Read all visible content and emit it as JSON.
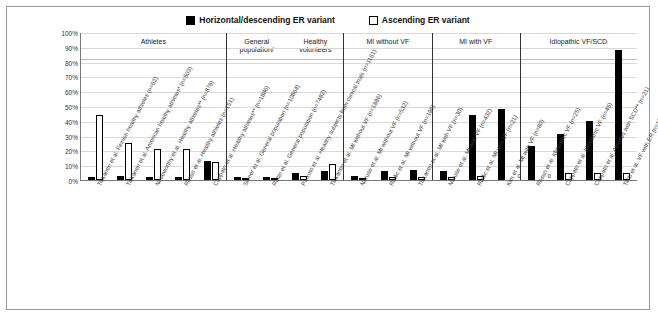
{
  "legend": {
    "items": [
      {
        "label": "Horizontal/descending ER variant",
        "swatch": "black"
      },
      {
        "label": "Ascending ER variant",
        "swatch": "white"
      }
    ]
  },
  "axis": {
    "yticks": [
      "100%",
      "90%",
      "80%",
      "70%",
      "60%",
      "50%",
      "40%",
      "30%",
      "20%",
      "10%",
      "0%"
    ]
  },
  "groups": [
    {
      "name": "Athletes",
      "count": 5
    },
    {
      "name": "General population/\nHealthy volunteers",
      "count": 4
    },
    {
      "name": "MI without VF",
      "count": 3
    },
    {
      "name": "MI with VF",
      "count": 3
    },
    {
      "name": "Idiopathic VF/SCD",
      "count": 4
    }
  ],
  "chart_data": {
    "type": "bar",
    "title": "",
    "xlabel": "",
    "ylabel": "",
    "ylim": [
      0,
      100
    ],
    "grid": true,
    "legend_position": "top-center",
    "categories": [
      "Tikkanen et al. Finnish healthy athletes (n=62)",
      "Tikkanen et al. American healthy athletes* (n=503)",
      "Noseworthy et al. Healthy athletes** (n=879)",
      "Rosso et al. Healthy athletes (n=151)",
      "Cappato et al. Healthy athletes** (n=1886)",
      "Sinner et al. General population (n=10864)",
      "Rollin et al. General population (n=7482)",
      "Paixoto et al. Healthy subjects from clinical trials (n=1161)",
      "Tikkanen et al. MI without VF (n=1886)",
      "Naruse et al. MI without VF (n=532)",
      "Rudic et al. MI without VF (n=199)",
      "Tikkanen et al. MI with VF (n=30)",
      "Naruse et al. MI with VF (n=432)",
      "Rudic et al. MI with VF (n=21)",
      "Kim et al. MI with VF (n=80)",
      "Rosso et al. Idiopathic VF (n=25)",
      "Cappato et al. Idiopathic VF (n=45)",
      "Cappato et al. Athletes with SCD** (n=21)",
      "Talib et al. VF with ER (n=10)"
    ],
    "series": [
      {
        "name": "Horizontal/descending ER variant",
        "color": "#000000",
        "values": [
          2,
          3,
          2,
          2,
          13,
          2,
          2,
          5,
          6,
          3,
          6,
          7,
          6,
          44,
          48,
          23,
          31,
          40,
          88
        ]
      },
      {
        "name": "Ascending ER variant",
        "color": "#ffffff",
        "values": [
          44,
          25,
          21,
          21,
          12,
          1,
          1,
          3,
          11,
          1,
          2,
          2,
          2,
          3,
          0,
          0,
          5,
          5,
          5
        ]
      }
    ],
    "annotations": [
      {
        "category": "Kim et al. MI with VF (n=80)",
        "series": "Ascending ER variant",
        "text": "0"
      },
      {
        "category": "Rosso et al. Idiopathic VF (n=25)",
        "series": "Ascending ER variant",
        "text": "0"
      }
    ]
  }
}
